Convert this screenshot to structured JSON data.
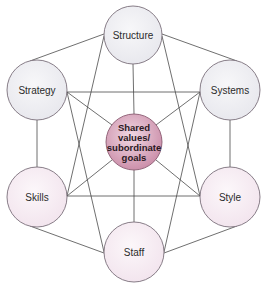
{
  "diagram": {
    "title": "",
    "colors": {
      "line": "#4a4a4a",
      "outline": "#7a6f7a",
      "hard_fill": "#eeeef2",
      "soft_fill": "#f7eef4",
      "center_fill_outer": "#c98aa6",
      "center_fill_inner": "#f1d9e4"
    },
    "nodes": {
      "structure": {
        "label": "Structure",
        "cx": 133,
        "cy": 35,
        "r": 29
      },
      "strategy": {
        "label": "Strategy",
        "cx": 37,
        "cy": 90,
        "r": 30
      },
      "systems": {
        "label": "Systems",
        "cx": 230,
        "cy": 90,
        "r": 30
      },
      "shared": {
        "lines": [
          "Shared",
          "values/",
          "subordinate",
          "goals"
        ],
        "cx": 134,
        "cy": 142,
        "r": 28
      },
      "skills": {
        "label": "Skills",
        "cx": 37,
        "cy": 197,
        "r": 30
      },
      "style": {
        "label": "Style",
        "cx": 230,
        "cy": 197,
        "r": 30
      },
      "staff": {
        "label": "Staff",
        "cx": 134,
        "cy": 252,
        "r": 30
      }
    },
    "edges": [
      [
        "structure",
        "strategy"
      ],
      [
        "structure",
        "systems"
      ],
      [
        "structure",
        "shared"
      ],
      [
        "structure",
        "skills"
      ],
      [
        "structure",
        "style"
      ],
      [
        "strategy",
        "systems"
      ],
      [
        "strategy",
        "skills"
      ],
      [
        "strategy",
        "shared"
      ],
      [
        "strategy",
        "staff"
      ],
      [
        "systems",
        "style"
      ],
      [
        "systems",
        "shared"
      ],
      [
        "systems",
        "staff"
      ],
      [
        "skills",
        "style"
      ],
      [
        "skills",
        "shared"
      ],
      [
        "skills",
        "staff"
      ],
      [
        "style",
        "shared"
      ],
      [
        "style",
        "staff"
      ],
      [
        "staff",
        "shared"
      ]
    ]
  }
}
